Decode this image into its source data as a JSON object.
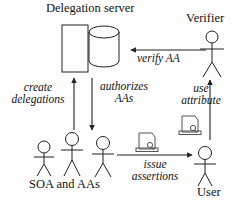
{
  "diagram": {
    "title_visible": false,
    "background_color": "#fdfdfd",
    "stroke_color": "#222222",
    "text_color": "#141414",
    "width": 241,
    "height": 206
  },
  "nodes": {
    "delegation_server": {
      "label": "Delegation server",
      "shapes": [
        "rectangle",
        "cylinder-database"
      ]
    },
    "verifier": {
      "label": "Verifier",
      "shape": "stick-figure"
    },
    "soa_and_aas": {
      "label": "SOA and AAs",
      "shape": "stick-figure-group",
      "count": 3
    },
    "user": {
      "label": "User",
      "shape": "stick-figure"
    }
  },
  "edges": {
    "verify_aa": {
      "label": "verify AA",
      "from": "verifier",
      "to": "delegation_server",
      "direction": "left"
    },
    "create_delegations": {
      "label_line1": "create",
      "label_line2": "delegations",
      "from": "soa_and_aas",
      "to": "delegation_server",
      "direction": "up"
    },
    "authorizes_aas": {
      "label_line1": "authorizes",
      "label_line2": "AAs",
      "from": "delegation_server",
      "to": "soa_and_aas",
      "direction": "down"
    },
    "issue_assertions": {
      "label_line1": "issue",
      "label_line2": "assertions",
      "from": "soa_and_aas",
      "to": "user",
      "direction": "right"
    },
    "use_attribute": {
      "label_line1": "use",
      "label_line2": "attribute",
      "from": "user",
      "to": "verifier",
      "direction": "up"
    }
  },
  "artifacts": {
    "assertion_certificate": {
      "name": "certificate-icon",
      "count": 2
    }
  }
}
